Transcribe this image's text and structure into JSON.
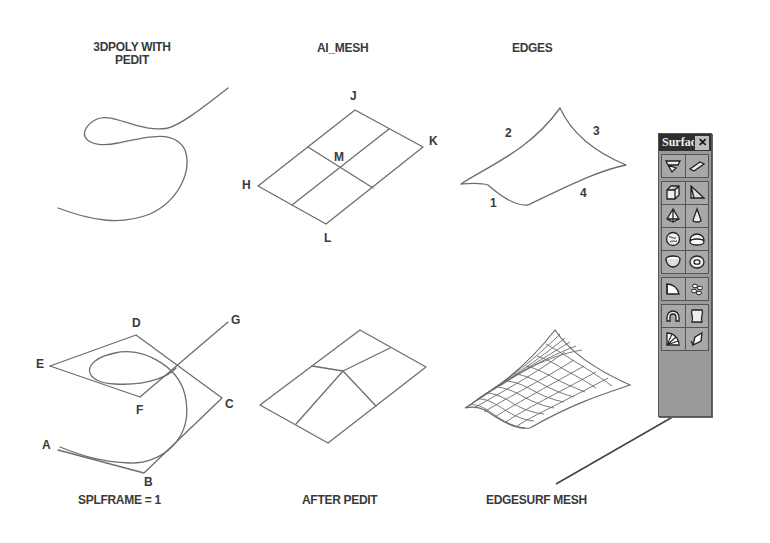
{
  "panels": {
    "poly3d": {
      "title_line1": "3DPOLY WITH",
      "title_line2": "PEDIT"
    },
    "ai_mesh": {
      "title": "AI_MESH",
      "points": {
        "J": "J",
        "K": "K",
        "M": "M",
        "H": "H",
        "L": "L"
      }
    },
    "edges": {
      "title": "EDGES",
      "edge_labels": {
        "e1": "1",
        "e2": "2",
        "e3": "3",
        "e4": "4"
      }
    },
    "splframe": {
      "caption": "SPLFRAME = 1",
      "points": {
        "A": "A",
        "B": "B",
        "C": "C",
        "D": "D",
        "E": "E",
        "F": "F",
        "G": "G"
      }
    },
    "after_pedit": {
      "caption": "AFTER PEDIT"
    },
    "edgesurf": {
      "caption": "EDGESURF MESH"
    }
  },
  "toolbar": {
    "title": "Surfac",
    "close_glyph": "✕",
    "groups": [
      [
        [
          "2d-solid-icon",
          "3d-face-icon"
        ]
      ],
      [
        [
          "box-icon",
          "wedge-icon"
        ],
        [
          "pyramid-icon",
          "cone-icon"
        ],
        [
          "sphere-icon",
          "dome-icon"
        ],
        [
          "dish-icon",
          "torus-icon"
        ]
      ],
      [
        [
          "revolved-surface-icon",
          "3d-mesh-icon"
        ]
      ],
      [
        [
          "revolved-surface-alt-icon",
          "ruled-surface-icon"
        ],
        [
          "edge-surface-icon",
          "tabulated-surface-icon"
        ]
      ]
    ]
  },
  "colors": {
    "line": "#6a6a6a",
    "text": "#3a3a3a",
    "toolbar_bg": "#9a9a9a",
    "toolbar_title_bg": "#2e2e2e"
  }
}
